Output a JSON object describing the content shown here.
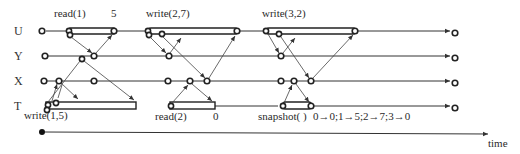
{
  "rows": [
    {
      "label": "U",
      "y": 31
    },
    {
      "label": "Y",
      "y": 56
    },
    {
      "label": "X",
      "y": 81
    },
    {
      "label": "T",
      "y": 106
    }
  ],
  "operations": [
    {
      "name": "read(1)",
      "result": "5",
      "row": "U"
    },
    {
      "name": "write(2,7)",
      "row": "U"
    },
    {
      "name": "write(3,2)",
      "row": "U"
    },
    {
      "name": "write(1,5)",
      "row": "T"
    },
    {
      "name": "read(2)",
      "result": "0",
      "row": "T"
    },
    {
      "name": "snapshot( )",
      "result": "0→0;1→5;2→7;3→0",
      "row": "T"
    }
  ],
  "axis": {
    "label": "time"
  },
  "colors": {
    "ink": "#222222",
    "background": "#ffffff"
  }
}
